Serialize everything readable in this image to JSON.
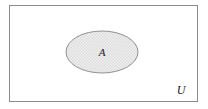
{
  "diagram": {
    "kind": "venn-diagram",
    "canvas": {
      "width": 208,
      "height": 109,
      "background": "#ffffff"
    },
    "universal_set": {
      "label": "U",
      "shape": "rectangle",
      "x": 9,
      "y": 5,
      "width": 189,
      "height": 97,
      "fill": "#ffffff",
      "stroke": "#8c8c8c",
      "stroke_width": 1,
      "label_x": 181,
      "label_y": 94
    },
    "subset": {
      "label": "A",
      "shape": "ellipse",
      "cx": 102,
      "cy": 52,
      "rx": 36,
      "ry": 21,
      "fill": "#ededed",
      "stroke": "#8c8c8c",
      "stroke_width": 1,
      "pattern": "fine-grid-stipple",
      "pattern_color": "#d8d8d8",
      "label_x": 102,
      "label_y": 56
    }
  }
}
